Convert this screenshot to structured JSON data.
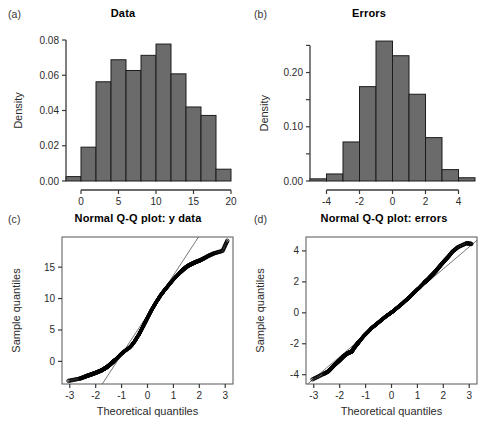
{
  "figure": {
    "background": "#ffffff",
    "bar_color": "#6b6b6b",
    "bar_edge_color": "#1c1c1c",
    "axis_color": "#3a3a3a",
    "point_color": "#000000"
  },
  "panels": {
    "a": {
      "tag": "(a)",
      "title": "Data"
    },
    "b": {
      "tag": "(b)",
      "title": "Errors"
    },
    "c": {
      "tag": "(c)",
      "title": "Normal Q-Q plot: y data"
    },
    "d": {
      "tag": "(d)",
      "title": "Normal Q-Q plot: errors"
    }
  },
  "chart_data": [
    {
      "panel": "a",
      "type": "bar",
      "title": "Data",
      "xlabel": "",
      "ylabel": "Density",
      "xlim": [
        -2,
        20
      ],
      "ylim": [
        0,
        0.08
      ],
      "xticks": [
        0,
        5,
        10,
        15,
        20
      ],
      "xtick_labels": [
        "0",
        "5",
        "10",
        "15",
        "20"
      ],
      "yticks": [
        0.0,
        0.02,
        0.04,
        0.06,
        0.08
      ],
      "ytick_labels": [
        "0.00",
        "0.02",
        "0.04",
        "0.06",
        "0.08"
      ],
      "grid": false,
      "legend": "none",
      "bin_edges": [
        -2,
        0,
        2,
        4,
        6,
        8,
        10,
        12,
        14,
        16,
        18,
        20
      ],
      "categories": [
        "-2to0",
        "0to2",
        "2to4",
        "4to6",
        "6to8",
        "8to10",
        "10to12",
        "12to14",
        "14to16",
        "16to18",
        "18to20"
      ],
      "values": [
        0.0025,
        0.0192,
        0.0563,
        0.0688,
        0.0627,
        0.0713,
        0.0777,
        0.0608,
        0.042,
        0.0372,
        0.0067
      ]
    },
    {
      "panel": "b",
      "type": "bar",
      "title": "Errors",
      "xlabel": "",
      "ylabel": "Density",
      "xlim": [
        -5,
        5
      ],
      "ylim": [
        0,
        0.26
      ],
      "xticks": [
        -4,
        -2,
        0,
        2,
        4
      ],
      "xtick_labels": [
        "-4",
        "-2",
        "0",
        "2",
        "4"
      ],
      "yticks": [
        0.0,
        0.05,
        0.1,
        0.15,
        0.2,
        0.25
      ],
      "ytick_labels": [
        "0.00",
        "",
        "0.10",
        "",
        "0.20",
        ""
      ],
      "ytick_labels_major": [
        "0.00",
        "0.10",
        "0.20"
      ],
      "grid": false,
      "legend": "none",
      "bin_edges": [
        -5,
        -4,
        -3,
        -2,
        -1,
        0,
        1,
        2,
        3,
        4,
        5
      ],
      "categories": [
        "-5to-4",
        "-4to-3",
        "-3to-2",
        "-2to-1",
        "-1to0",
        "0to1",
        "1to2",
        "2to3",
        "3to4",
        "4to5"
      ],
      "values": [
        0.004,
        0.013,
        0.072,
        0.174,
        0.258,
        0.231,
        0.16,
        0.08,
        0.021,
        0.006
      ]
    },
    {
      "panel": "c",
      "type": "scatter",
      "title": "Normal Q-Q plot: y data",
      "xlabel": "Theoretical quantiles",
      "ylabel": "Sample quantiles",
      "xlim": [
        -3.3,
        3.3
      ],
      "ylim": [
        -3.6,
        19.8
      ],
      "xticks": [
        -3,
        -2,
        -1,
        0,
        1,
        2,
        3
      ],
      "xtick_labels": [
        "-3",
        "-2",
        "-1",
        "0",
        "1",
        "2",
        "3"
      ],
      "yticks": [
        0,
        5,
        10,
        15
      ],
      "ytick_labels": [
        "0",
        "5",
        "10",
        "15"
      ],
      "grid": false,
      "legend": "none",
      "reference_line": {
        "slope": 6.3,
        "intercept": 7.4
      },
      "note": "S-shaped / light-tailed pattern: sample quantiles flatten at both ends relative to reference line",
      "x": [
        -3.05,
        -2.62,
        -2.45,
        -2.33,
        -2.22,
        -2.12,
        -2.02,
        -1.93,
        -1.84,
        -1.76,
        -1.68,
        -1.6,
        -1.53,
        -1.46,
        -1.39,
        -1.32,
        -1.26,
        -1.19,
        -1.13,
        -1.07,
        -1.01,
        -0.95,
        -0.89,
        -0.83,
        -0.78,
        -0.72,
        -0.67,
        -0.61,
        -0.56,
        -0.5,
        -0.45,
        -0.4,
        -0.34,
        -0.29,
        -0.24,
        -0.19,
        -0.14,
        -0.09,
        -0.04,
        0.01,
        0.06,
        0.11,
        0.16,
        0.21,
        0.26,
        0.31,
        0.36,
        0.42,
        0.47,
        0.52,
        0.58,
        0.63,
        0.69,
        0.75,
        0.81,
        0.87,
        0.93,
        0.99,
        1.06,
        1.13,
        1.2,
        1.27,
        1.35,
        1.43,
        1.51,
        1.6,
        1.7,
        1.8,
        1.91,
        2.04,
        2.18,
        2.35,
        2.57,
        2.9,
        3.08
      ],
      "y": [
        -3.1,
        -2.75,
        -2.5,
        -2.3,
        -2.15,
        -2.0,
        -1.85,
        -1.7,
        -1.55,
        -1.4,
        -1.2,
        -1.0,
        -0.8,
        -0.55,
        -0.3,
        -0.05,
        0.2,
        0.45,
        0.7,
        0.95,
        1.2,
        1.4,
        1.6,
        1.8,
        1.95,
        2.1,
        2.3,
        2.55,
        2.85,
        3.15,
        3.5,
        3.85,
        4.2,
        4.6,
        5.0,
        5.4,
        5.8,
        6.2,
        6.6,
        7.0,
        7.4,
        7.8,
        8.2,
        8.55,
        8.9,
        9.25,
        9.6,
        9.95,
        10.3,
        10.6,
        10.9,
        11.2,
        11.5,
        11.8,
        12.1,
        12.4,
        12.7,
        13.0,
        13.3,
        13.6,
        13.9,
        14.2,
        14.5,
        14.8,
        15.05,
        15.3,
        15.5,
        15.7,
        15.9,
        16.1,
        16.4,
        16.8,
        17.2,
        17.6,
        19.2
      ]
    },
    {
      "panel": "d",
      "type": "scatter",
      "title": "Normal Q-Q plot: errors",
      "xlabel": "Theoretical quantiles",
      "ylabel": "Sample quantiles",
      "xlim": [
        -3.3,
        3.3
      ],
      "ylim": [
        -4.6,
        4.9
      ],
      "xticks": [
        -3,
        -2,
        -1,
        0,
        1,
        2,
        3
      ],
      "xtick_labels": [
        "-3",
        "-2",
        "-1",
        "0",
        "1",
        "2",
        "3"
      ],
      "yticks": [
        -4,
        -2,
        0,
        2,
        4
      ],
      "ytick_labels": [
        "-4",
        "-2",
        "0",
        "2",
        "4"
      ],
      "grid": false,
      "legend": "none",
      "reference_line": {
        "slope": 1.42,
        "intercept": 0.0
      },
      "note": "Points follow the reference line closely: errors are approximately normal",
      "x": [
        -3.05,
        -2.62,
        -2.45,
        -2.33,
        -2.22,
        -2.12,
        -2.02,
        -1.93,
        -1.84,
        -1.76,
        -1.68,
        -1.6,
        -1.53,
        -1.46,
        -1.39,
        -1.32,
        -1.26,
        -1.19,
        -1.13,
        -1.07,
        -1.01,
        -0.95,
        -0.89,
        -0.83,
        -0.78,
        -0.72,
        -0.67,
        -0.61,
        -0.56,
        -0.5,
        -0.45,
        -0.4,
        -0.34,
        -0.29,
        -0.24,
        -0.19,
        -0.14,
        -0.09,
        -0.04,
        0.01,
        0.06,
        0.11,
        0.16,
        0.21,
        0.26,
        0.31,
        0.36,
        0.42,
        0.47,
        0.52,
        0.58,
        0.63,
        0.69,
        0.75,
        0.81,
        0.87,
        0.93,
        0.99,
        1.06,
        1.13,
        1.2,
        1.27,
        1.35,
        1.43,
        1.51,
        1.6,
        1.7,
        1.8,
        1.91,
        2.04,
        2.18,
        2.35,
        2.57,
        2.9,
        3.08
      ],
      "y": [
        -4.3,
        -3.95,
        -3.8,
        -3.6,
        -3.4,
        -3.25,
        -3.1,
        -2.95,
        -2.8,
        -2.7,
        -2.6,
        -2.55,
        -2.5,
        -2.3,
        -2.15,
        -2.0,
        -1.88,
        -1.75,
        -1.62,
        -1.5,
        -1.4,
        -1.3,
        -1.2,
        -1.1,
        -1.0,
        -0.92,
        -0.85,
        -0.78,
        -0.7,
        -0.62,
        -0.55,
        -0.48,
        -0.4,
        -0.33,
        -0.26,
        -0.2,
        -0.14,
        -0.08,
        -0.02,
        0.04,
        0.1,
        0.17,
        0.24,
        0.31,
        0.38,
        0.45,
        0.52,
        0.6,
        0.68,
        0.76,
        0.84,
        0.92,
        1.0,
        1.1,
        1.2,
        1.3,
        1.4,
        1.5,
        1.6,
        1.72,
        1.84,
        1.96,
        2.08,
        2.2,
        2.35,
        2.5,
        2.68,
        2.88,
        3.1,
        3.35,
        3.6,
        3.95,
        4.25,
        4.5,
        4.45
      ]
    }
  ]
}
